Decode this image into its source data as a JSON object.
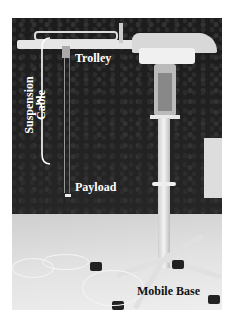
{
  "figure": {
    "labels": {
      "trolley": "Trolley",
      "suspension_cable_line1": "Suspension",
      "suspension_cable_line2": "Cable",
      "payload": "Payload",
      "mobile_base": "Mobile Base"
    }
  }
}
